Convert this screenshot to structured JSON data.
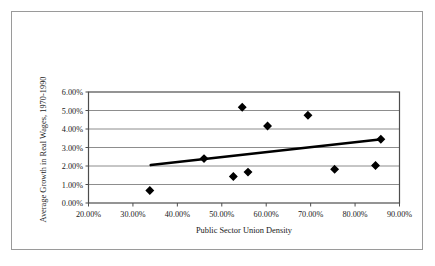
{
  "chart_data": {
    "type": "scatter",
    "title": "",
    "xlabel": "Public Sector Union Density",
    "ylabel": "Average Growth in Real Wages, 1970-1990",
    "xlim": [
      20,
      90
    ],
    "ylim": [
      0,
      6
    ],
    "xticks": [
      20,
      30,
      40,
      50,
      60,
      70,
      80,
      90
    ],
    "yticks": [
      0,
      1,
      2,
      3,
      4,
      5,
      6
    ],
    "xtick_labels": [
      "20.00%",
      "30.00%",
      "40.00%",
      "50.00%",
      "60.00%",
      "70.00%",
      "80.00%",
      "90.00%"
    ],
    "ytick_labels": [
      "0.00%",
      "1.00%",
      "2.00%",
      "3.00%",
      "4.00%",
      "5.00%",
      "6.00%"
    ],
    "grid": "horizontal",
    "legend": "none",
    "marker": "diamond",
    "marker_color": "#000000",
    "series": [
      {
        "name": "Countries",
        "points": [
          {
            "x": 33.8,
            "y": 0.68
          },
          {
            "x": 46.0,
            "y": 2.4
          },
          {
            "x": 52.6,
            "y": 1.43
          },
          {
            "x": 54.6,
            "y": 5.18
          },
          {
            "x": 55.9,
            "y": 1.67
          },
          {
            "x": 60.3,
            "y": 4.16
          },
          {
            "x": 69.4,
            "y": 4.74
          },
          {
            "x": 75.4,
            "y": 1.82
          },
          {
            "x": 84.6,
            "y": 2.03
          },
          {
            "x": 85.8,
            "y": 3.45
          }
        ]
      }
    ],
    "trendline": {
      "name": "Linear fit",
      "color": "#000000",
      "x_start": 34.0,
      "y_start": 2.05,
      "x_end": 86.0,
      "y_end": 3.45
    }
  },
  "colors": {
    "outer_border": "#9a9a9a",
    "plot_border": "#4d4d4d",
    "gridline": "#808080",
    "marker": "#000000",
    "trendline": "#000000",
    "background": "#ffffff",
    "text": "#1a1a1a"
  }
}
